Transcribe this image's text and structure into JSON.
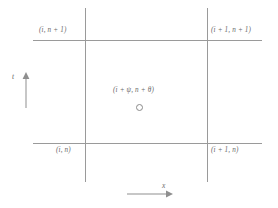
{
  "figure": {
    "name": "finite-difference-grid-cell",
    "nodes": {
      "top_left": "(i, n + 1)",
      "top_right": "(i + 1, n + 1)",
      "bottom_left": "(i, n)",
      "bottom_right": "(i + 1, n)",
      "center": "(i + ψ, n + θ)"
    },
    "axes": {
      "vertical_label": "t",
      "horizontal_label": "x"
    },
    "colors": {
      "line": "#9a9a9a",
      "text": "#6a6a6a",
      "background": "#ffffff"
    }
  }
}
